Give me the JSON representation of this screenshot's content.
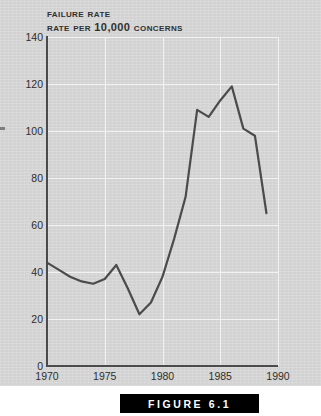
{
  "figure": {
    "caption": "FIGURE 6.1",
    "caption_bar_color": "#000000",
    "caption_text_color": "#ffffff",
    "page_background": "#d2d2d2"
  },
  "chart_data": {
    "type": "line",
    "title": "Failure Rate",
    "subtitle": "Rate per 10,000 concerns",
    "xlabel": "",
    "ylabel": "",
    "xlim": [
      1970,
      1990
    ],
    "ylim": [
      0,
      140
    ],
    "xticks": [
      1970,
      1975,
      1980,
      1985,
      1990
    ],
    "yticks": [
      0,
      20,
      40,
      60,
      80,
      100,
      120,
      140
    ],
    "grid": true,
    "legend": "none",
    "line_color": "#4b4b4b",
    "x": [
      1970,
      1971,
      1972,
      1973,
      1974,
      1975,
      1976,
      1977,
      1978,
      1979,
      1980,
      1981,
      1982,
      1983,
      1984,
      1985,
      1986,
      1987,
      1988,
      1989
    ],
    "values": [
      44,
      41,
      38,
      36,
      35,
      37,
      43,
      33,
      22,
      27,
      38,
      54,
      72,
      109,
      106,
      113,
      119,
      101,
      98,
      65
    ],
    "series": [
      {
        "name": "Failure rate per 10,000 concerns",
        "values": [
          44,
          41,
          38,
          36,
          35,
          37,
          43,
          33,
          22,
          27,
          38,
          54,
          72,
          109,
          106,
          113,
          119,
          101,
          98,
          65
        ]
      }
    ]
  }
}
